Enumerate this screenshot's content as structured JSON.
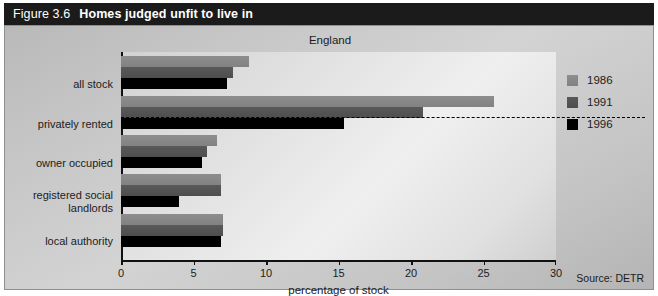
{
  "figure": {
    "number": "Figure 3.6",
    "title": "Homes judged unfit to live in",
    "source": "Source: DETR"
  },
  "legend": {
    "position": "right",
    "entries": [
      {
        "label": "1986",
        "color": "#8a8a8a"
      },
      {
        "label": "1991",
        "color": "#555555"
      },
      {
        "label": "1996",
        "color": "#000000"
      }
    ]
  },
  "chart_data": {
    "type": "bar",
    "orientation": "horizontal",
    "title": "Homes judged unfit to live in",
    "subtitle": "England",
    "xlabel": "percentage of stock",
    "ylabel": "",
    "xlim": [
      0,
      30
    ],
    "xticks": [
      "0",
      "5",
      "10",
      "15",
      "20",
      "25",
      "30"
    ],
    "grid": false,
    "categories": [
      "all stock",
      "privately rented",
      "owner occupied",
      "registered social landlords",
      "local authority"
    ],
    "series": [
      {
        "name": "1986",
        "color": "#8a8a8a",
        "values": [
          8.8,
          25.7,
          6.6,
          6.9,
          7.0
        ]
      },
      {
        "name": "1991",
        "color": "#555555",
        "values": [
          7.7,
          20.8,
          5.9,
          6.9,
          7.0
        ]
      },
      {
        "name": "1996",
        "color": "#000000",
        "values": [
          7.3,
          15.4,
          5.6,
          4.0,
          6.9
        ]
      }
    ],
    "annotations": [
      {
        "type": "dashed-reference-line",
        "orientation": "horizontal",
        "note": "dashed line below the all stock group"
      }
    ]
  }
}
